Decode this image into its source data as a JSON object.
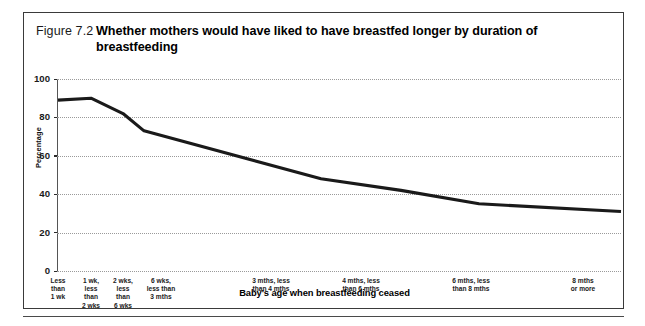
{
  "figure": {
    "number": "Figure 7.2",
    "title": "Whether mothers would have liked to have breastfed longer by duration of breastfeeding"
  },
  "chart_data": {
    "type": "line",
    "title": "Whether mothers would have liked to have breastfed longer by duration of breastfeeding",
    "xlabel": "Baby's age when breastfeeding ceased",
    "ylabel": "Percentage",
    "ylim": [
      0,
      100
    ],
    "yticks": [
      0,
      20,
      40,
      60,
      80,
      100
    ],
    "grid": true,
    "legend": false,
    "categories": [
      "Less than 1 wk",
      "1 wk, less than 2 wks",
      "2 wks, less than 6 wks",
      "6 wks, less than 3 mths",
      "3 mths, less than 4 mths",
      "4 mths, less than 6 mths",
      "6 mths, less than 8 mths",
      "8 mths or more"
    ],
    "values": [
      89,
      90,
      82,
      73,
      48,
      42,
      35,
      31
    ],
    "x_positions": [
      57,
      90,
      122,
      143,
      320,
      400,
      478,
      620
    ],
    "line_color": "#1a1a1a"
  },
  "x_tick_labels": [
    {
      "text": "Less\nthan\n1 wk",
      "center": 57
    },
    {
      "text": "1 wk,\nless\nthan\n2 wks",
      "center": 90
    },
    {
      "text": "2 wks,\nless\nthan\n6 wks",
      "center": 122
    },
    {
      "text": "6 wks,\nless than\n3 mths",
      "center": 160
    },
    {
      "text": "3 mths, less\nthan 4 mths",
      "center": 270
    },
    {
      "text": "4 mths, less\nthan 6 mths",
      "center": 360
    },
    {
      "text": "6 mths, less\nthan 8 mths",
      "center": 470
    },
    {
      "text": "8 mths\nor more",
      "center": 582
    }
  ],
  "y_tick_labels": [
    "100",
    "80",
    "60",
    "40",
    "20",
    "0"
  ]
}
